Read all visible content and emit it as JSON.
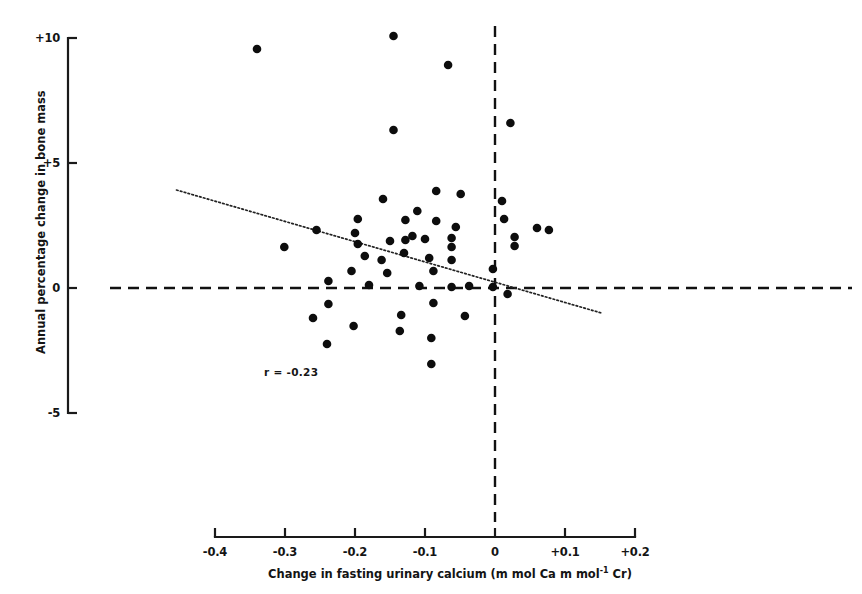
{
  "chart_data": {
    "type": "scatter",
    "title": "",
    "xlabel": "Change in fasting urinary calcium (m mol Ca m mol⁻¹ Cr)",
    "ylabel": "Annual percentage change in bone mass",
    "xlim": [
      -0.4,
      0.2
    ],
    "ylim": [
      -5,
      10
    ],
    "grid": false,
    "legend": null,
    "xticks": [
      "-0.4",
      "-0.3",
      "-0.2",
      "-0.1",
      "0",
      "+0.1",
      "+0.2"
    ],
    "xtick_values": [
      -0.4,
      -0.3,
      -0.2,
      -0.1,
      0,
      0.1,
      0.2
    ],
    "yticks": [
      "+10",
      "+5",
      "0",
      "-5"
    ],
    "ytick_values": [
      10,
      5,
      0,
      -5
    ],
    "annotations": [
      {
        "text": "r = -0.23",
        "x": -0.33,
        "y": -3.4
      }
    ],
    "reference_lines": [
      {
        "orientation": "horizontal",
        "value": 0,
        "style": "dashed"
      },
      {
        "orientation": "vertical",
        "value": 0,
        "style": "dashed"
      }
    ],
    "trend_line": {
      "style": "dotted",
      "x_start": -0.455,
      "y_start": 3.92,
      "x_end": 0.152,
      "y_end": -1.0
    },
    "points": [
      {
        "x": -0.34,
        "y": 9.56
      },
      {
        "x": -0.145,
        "y": 10.08
      },
      {
        "x": -0.067,
        "y": 8.92
      },
      {
        "x": -0.145,
        "y": 6.32
      },
      {
        "x": 0.022,
        "y": 6.6
      },
      {
        "x": -0.084,
        "y": 3.88
      },
      {
        "x": -0.16,
        "y": 3.56
      },
      {
        "x": -0.049,
        "y": 3.76
      },
      {
        "x": 0.01,
        "y": 3.48
      },
      {
        "x": -0.255,
        "y": 2.32
      },
      {
        "x": -0.196,
        "y": 2.76
      },
      {
        "x": -0.128,
        "y": 2.72
      },
      {
        "x": -0.084,
        "y": 2.68
      },
      {
        "x": -0.056,
        "y": 2.44
      },
      {
        "x": -0.111,
        "y": 3.08
      },
      {
        "x": 0.013,
        "y": 2.76
      },
      {
        "x": 0.06,
        "y": 2.4
      },
      {
        "x": -0.301,
        "y": 1.64
      },
      {
        "x": -0.2,
        "y": 2.2
      },
      {
        "x": -0.196,
        "y": 1.76
      },
      {
        "x": -0.15,
        "y": 1.88
      },
      {
        "x": -0.128,
        "y": 1.92
      },
      {
        "x": -0.118,
        "y": 2.08
      },
      {
        "x": -0.1,
        "y": 1.96
      },
      {
        "x": -0.062,
        "y": 2.0
      },
      {
        "x": -0.062,
        "y": 1.64
      },
      {
        "x": 0.028,
        "y": 2.04
      },
      {
        "x": 0.028,
        "y": 1.68
      },
      {
        "x": 0.077,
        "y": 2.32
      },
      {
        "x": -0.186,
        "y": 1.28
      },
      {
        "x": -0.162,
        "y": 1.12
      },
      {
        "x": -0.13,
        "y": 1.4
      },
      {
        "x": -0.094,
        "y": 1.2
      },
      {
        "x": -0.062,
        "y": 1.12
      },
      {
        "x": -0.205,
        "y": 0.68
      },
      {
        "x": -0.154,
        "y": 0.6
      },
      {
        "x": -0.088,
        "y": 0.68
      },
      {
        "x": -0.003,
        "y": 0.76
      },
      {
        "x": -0.238,
        "y": 0.28
      },
      {
        "x": -0.18,
        "y": 0.12
      },
      {
        "x": -0.108,
        "y": 0.08
      },
      {
        "x": -0.062,
        "y": 0.04
      },
      {
        "x": -0.037,
        "y": 0.08
      },
      {
        "x": -0.003,
        "y": 0.04
      },
      {
        "x": 0.018,
        "y": -0.24
      },
      {
        "x": -0.238,
        "y": -0.64
      },
      {
        "x": -0.088,
        "y": -0.6
      },
      {
        "x": -0.26,
        "y": -1.2
      },
      {
        "x": -0.134,
        "y": -1.08
      },
      {
        "x": -0.043,
        "y": -1.12
      },
      {
        "x": -0.202,
        "y": -1.52
      },
      {
        "x": -0.136,
        "y": -1.72
      },
      {
        "x": -0.24,
        "y": -2.24
      },
      {
        "x": -0.091,
        "y": -2.0
      },
      {
        "x": -0.091,
        "y": -3.04
      }
    ]
  },
  "axes": {
    "y_title": "Annual percentage change in bone mass",
    "x_title_main": "Change in fasting urinary calcium (m mol Ca m mol",
    "x_title_sup": "-1",
    "x_title_tail": " Cr)"
  }
}
